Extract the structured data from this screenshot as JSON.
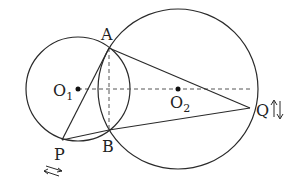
{
  "diagram": {
    "type": "geometry",
    "stroke_color": "#2a2a2a",
    "circles": [
      {
        "name": "circle-O1",
        "center": "O1",
        "cx": 78,
        "cy": 89,
        "r": 52
      },
      {
        "name": "circle-O2",
        "center": "O2",
        "cx": 178,
        "cy": 89,
        "r": 80
      }
    ],
    "points": {
      "A": {
        "label": "A",
        "x": 109,
        "y": 48
      },
      "B": {
        "label": "B",
        "x": 109,
        "y": 130
      },
      "P": {
        "label": "P",
        "x": 62,
        "y": 140
      },
      "Q": {
        "label": "Q",
        "x": 250,
        "y": 108
      },
      "O1": {
        "label": "O",
        "sub": "1",
        "x": 78,
        "y": 89
      },
      "O2": {
        "label": "O",
        "sub": "2",
        "x": 178,
        "y": 89
      }
    },
    "segments_solid": [
      [
        "A",
        "P"
      ],
      [
        "P",
        "B"
      ],
      [
        "B",
        "Q"
      ],
      [
        "A",
        "Q"
      ]
    ],
    "segments_dashed": [
      [
        "O1",
        "O2"
      ],
      [
        "A",
        "B"
      ]
    ],
    "motion_indicators": {
      "P": "arrows-left-right",
      "Q": "arrows-up-down"
    }
  }
}
